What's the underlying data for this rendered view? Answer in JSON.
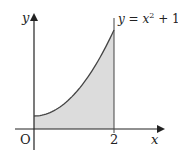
{
  "diagram": {
    "function_label": "y = x² + 1",
    "function_label_parts": {
      "lhs": "y",
      "eq": " = ",
      "var": "x",
      "exp": "2",
      "rest": " + 1"
    },
    "axis_labels": {
      "x": "x",
      "y": "y",
      "origin": "O"
    },
    "tick_labels": [
      "2"
    ],
    "shaded_region": {
      "from_x": 0,
      "to_x": 2,
      "under": "y = x² + 1"
    },
    "colors": {
      "curve": "#444444",
      "shade": "#dcdcdc",
      "axes": "#222222"
    }
  }
}
